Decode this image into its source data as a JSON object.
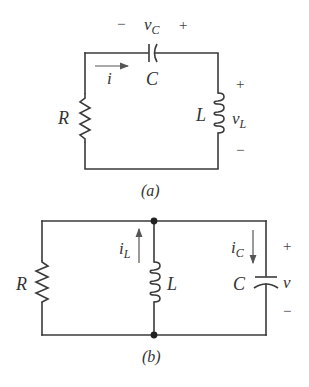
{
  "diagrams": [
    {
      "id": "a",
      "caption": "(a)",
      "topology": "series RLC",
      "components": {
        "resistor": {
          "label": "R"
        },
        "capacitor": {
          "label": "C",
          "voltage_label": "v",
          "voltage_sub": "C",
          "plus": "+",
          "minus": "−"
        },
        "inductor": {
          "label": "L",
          "voltage_label": "v",
          "voltage_sub": "L",
          "plus": "+",
          "minus": "−"
        }
      },
      "current": {
        "label": "i",
        "direction": "right"
      }
    },
    {
      "id": "b",
      "caption": "(b)",
      "topology": "parallel RLC",
      "components": {
        "resistor": {
          "label": "R"
        },
        "inductor": {
          "label": "L",
          "current_label": "i",
          "current_sub": "L",
          "current_direction": "up"
        },
        "capacitor": {
          "label": "C",
          "current_label": "i",
          "current_sub": "C",
          "current_direction": "down"
        }
      },
      "voltage": {
        "label": "v",
        "plus": "+",
        "minus": "−"
      }
    }
  ],
  "colors": {
    "wire": "#3a3a3a",
    "text": "#333333",
    "background": "#ffffff"
  }
}
